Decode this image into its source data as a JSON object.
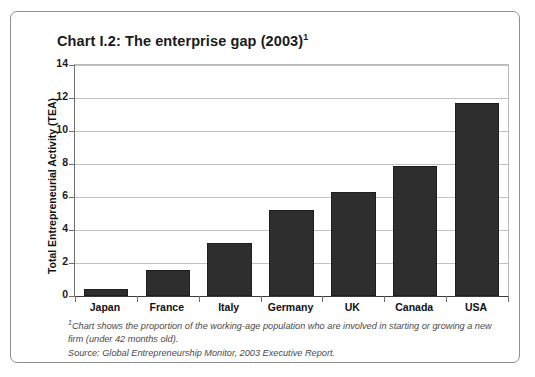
{
  "chart_data": {
    "type": "bar",
    "title": "Chart I.2: The enterprise gap (2003)",
    "title_superscript": "1",
    "categories": [
      "Japan",
      "France",
      "Italy",
      "Germany",
      "UK",
      "Canada",
      "USA"
    ],
    "values": [
      0.4,
      1.6,
      3.2,
      5.2,
      6.3,
      7.9,
      11.7
    ],
    "xlabel": "",
    "ylabel": "Total Entrepreneurial Activity (TEA)",
    "ylim": [
      0,
      14
    ],
    "ytick_values": [
      0,
      2,
      4,
      6,
      8,
      10,
      12,
      14
    ],
    "ytick_labels": [
      "0",
      "2",
      "4",
      "6",
      "8",
      "10",
      "12",
      "14"
    ],
    "grid": true,
    "legend": false,
    "bar_color": "#2e2e2e",
    "gridline_color": "#c2c2c2",
    "axis_color": "#6e6e6e"
  },
  "footnotes": {
    "note_superscript": "1",
    "note": "Chart shows the proportion of the working-age population who are involved in starting or growing a new firm (under 42 months old).",
    "source": "Source: Global Entrepreneurship Monitor, 2003 Executive Report."
  }
}
